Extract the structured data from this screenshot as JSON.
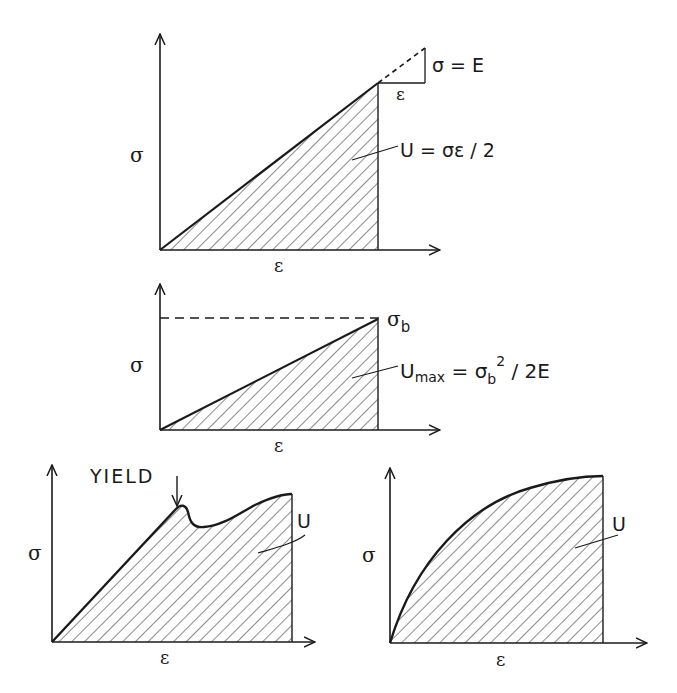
{
  "panels": [
    {
      "id": "linear-elastic",
      "y_axis_label": "σ",
      "x_axis_label": "ε",
      "slope_triangle": {
        "rise_label": "σ = E",
        "run_label": "ε"
      },
      "area_label": "U = σε / 2"
    },
    {
      "id": "linear-to-failure",
      "y_axis_label": "σ",
      "x_axis_label": "ε",
      "peak_label": "σ",
      "peak_subscript": "b",
      "area_label_main": "U",
      "area_label_sub": "max",
      "area_label_eq": " = σ",
      "area_label_eq_sub": "b",
      "area_label_sup": "2",
      "area_label_tail": " / 2E"
    },
    {
      "id": "yielding-material",
      "y_axis_label": "σ",
      "x_axis_label": "ε",
      "yield_label": "YIELD",
      "area_label": "U"
    },
    {
      "id": "nonlinear-material",
      "y_axis_label": "σ",
      "x_axis_label": "ε",
      "area_label": "U"
    }
  ],
  "colors": {
    "ink": "#1a1a1a",
    "background": "#ffffff"
  }
}
